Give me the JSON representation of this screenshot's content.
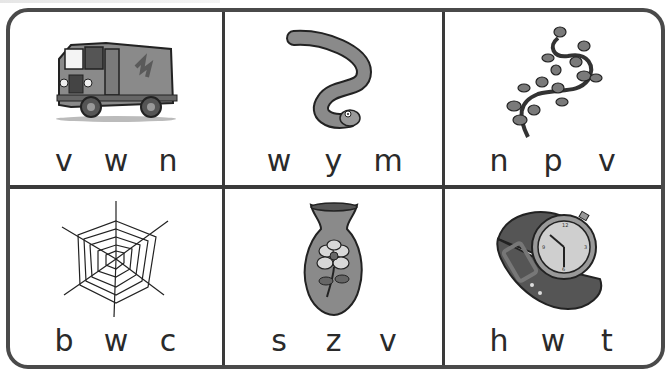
{
  "worksheet": {
    "cells": [
      {
        "picture": "truck",
        "icon": "truck-icon",
        "choices": [
          "v",
          "w",
          "n"
        ]
      },
      {
        "picture": "worm",
        "icon": "worm-icon",
        "choices": [
          "w",
          "y",
          "m"
        ]
      },
      {
        "picture": "vine",
        "icon": "vine-icon",
        "choices": [
          "n",
          "p",
          "v"
        ]
      },
      {
        "picture": "web",
        "icon": "spider-web-icon",
        "choices": [
          "b",
          "w",
          "c"
        ]
      },
      {
        "picture": "vase",
        "icon": "vase-icon",
        "choices": [
          "s",
          "z",
          "v"
        ]
      },
      {
        "picture": "watch",
        "icon": "wristwatch-icon",
        "choices": [
          "h",
          "w",
          "t"
        ]
      }
    ]
  },
  "colors": {
    "border": "#3a3a3a",
    "art_fill": "#8a8a8a",
    "letter": "#2a2a2a"
  }
}
